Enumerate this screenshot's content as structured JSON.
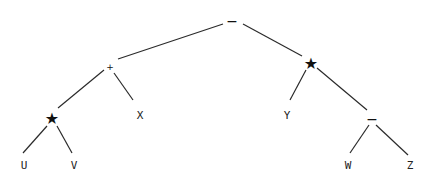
{
  "diagram": {
    "type": "expression-tree",
    "nodes": {
      "root": {
        "label": "−",
        "role": "operator-minus"
      },
      "plus": {
        "label": "+",
        "role": "operator-plus"
      },
      "star_right": {
        "label": "★",
        "role": "operator-star"
      },
      "star_left": {
        "label": "★",
        "role": "operator-star"
      },
      "minus_inner": {
        "label": "−",
        "role": "operator-minus"
      },
      "U": {
        "label": "U"
      },
      "V": {
        "label": "V"
      },
      "X": {
        "label": "X"
      },
      "Y": {
        "label": "Y"
      },
      "W": {
        "label": "W"
      },
      "Z": {
        "label": "Z"
      }
    },
    "edges": [
      [
        "root",
        "plus"
      ],
      [
        "root",
        "star_right"
      ],
      [
        "plus",
        "star_left"
      ],
      [
        "plus",
        "X"
      ],
      [
        "star_left",
        "U"
      ],
      [
        "star_left",
        "V"
      ],
      [
        "star_right",
        "Y"
      ],
      [
        "star_right",
        "minus_inner"
      ],
      [
        "minus_inner",
        "W"
      ],
      [
        "minus_inner",
        "Z"
      ]
    ]
  }
}
